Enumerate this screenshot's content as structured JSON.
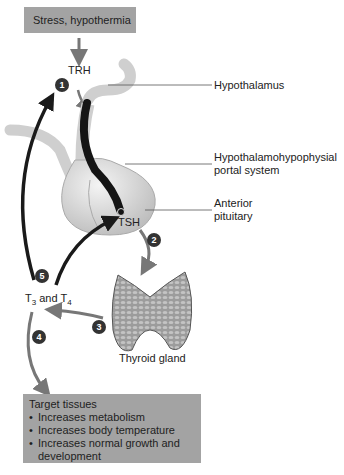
{
  "stimulus_box": {
    "text": "Stress, hypothermia"
  },
  "hormones": {
    "trh": "TRH",
    "tsh": "TSH",
    "t3": "T",
    "t3_sub": "3",
    "and": " and T",
    "t4_sub": "4"
  },
  "labels": {
    "hypothalamus": "Hypothalamus",
    "portal_line1": "Hypothalamohypophysial",
    "portal_line2": "portal system",
    "pituitary_line1": "Anterior",
    "pituitary_line2": "pituitary",
    "thyroid": "Thyroid gland"
  },
  "steps": [
    "1",
    "2",
    "3",
    "4",
    "5"
  ],
  "target_box": {
    "title": "Target tissues",
    "items": [
      "Increases metabolism",
      "Increases body temperature",
      "Increases normal growth and development"
    ]
  }
}
